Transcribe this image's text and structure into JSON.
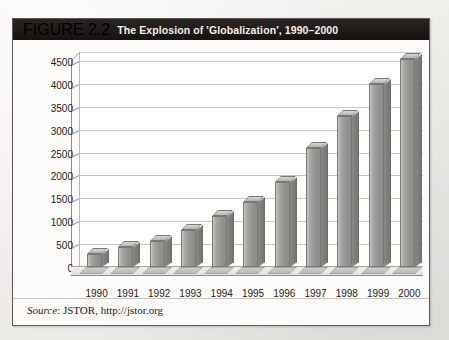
{
  "figure": {
    "number": "FIGURE 2.2",
    "title": "The Explosion of 'Globalization', 1990–2000",
    "source_prefix": "Source",
    "source_text": ": JSTOR, http://jstor.org"
  },
  "chart_data": {
    "type": "bar",
    "title": "The Explosion of 'Globalization', 1990–2000",
    "xlabel": "",
    "ylabel": "",
    "categories": [
      "1990",
      "1991",
      "1992",
      "1993",
      "1994",
      "1995",
      "1996",
      "1997",
      "1998",
      "1999",
      "2000"
    ],
    "values": [
      280,
      430,
      560,
      800,
      1120,
      1430,
      1850,
      2600,
      3300,
      4000,
      4550
    ],
    "ylim": [
      0,
      4500
    ],
    "ytick_labels": [
      "4500",
      "4000",
      "3500",
      "3000",
      "2500",
      "2000",
      "1500",
      "1000",
      "500",
      "0"
    ],
    "ytick_values": [
      4500,
      4000,
      3500,
      3000,
      2500,
      2000,
      1500,
      1000,
      500,
      0
    ],
    "grid": true,
    "legend": false,
    "series_color": "#97958f",
    "style": "3d-column"
  }
}
